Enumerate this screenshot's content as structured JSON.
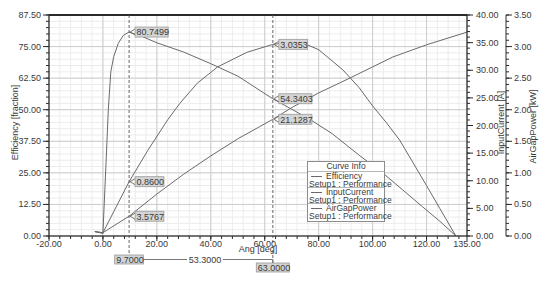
{
  "chart_data": {
    "type": "line",
    "title": "",
    "grid": true,
    "x_axis": {
      "label": "Ang [deg]",
      "range": [
        -20,
        135
      ],
      "ticks": [
        -20,
        0,
        20,
        40,
        60,
        80,
        100,
        120,
        135
      ],
      "tick_labels": [
        "-20.00",
        "0.00",
        "20.00",
        "40.00",
        "60.00",
        "80.00",
        "100.00",
        "120.00",
        "135.00"
      ],
      "minor_step": 4
    },
    "y_axes": [
      {
        "id": "left",
        "label": "Efficiency [fraction]",
        "range": [
          0,
          87.5
        ],
        "ticks": [
          0,
          12.5,
          25,
          37.5,
          50,
          62.5,
          75,
          87.5
        ],
        "tick_labels": [
          "0.00",
          "12.50",
          "25.00",
          "37.50",
          "50.00",
          "62.50",
          "75.00",
          "87.50"
        ],
        "minor_step": 2.5
      },
      {
        "id": "right1",
        "label": "InputCurrent [A]",
        "range": [
          0,
          40
        ],
        "ticks": [
          0,
          5,
          10,
          15,
          20,
          25,
          30,
          35,
          40
        ],
        "tick_labels": [
          "0.00",
          "5.00",
          "10.00",
          "15.00",
          "20.00",
          "25.00",
          "30.00",
          "35.00",
          "40.00"
        ],
        "minor_step": 1
      },
      {
        "id": "right2",
        "label": "AirGapPower [kW]",
        "range": [
          0,
          3.5
        ],
        "ticks": [
          0,
          0.5,
          1,
          1.5,
          2,
          2.5,
          3,
          3.5
        ],
        "tick_labels": [
          "0.00",
          "0.50",
          "1.00",
          "1.50",
          "2.00",
          "2.50",
          "3.00",
          "3.50"
        ],
        "minor_step": 0.1
      }
    ],
    "series": [
      {
        "name": "Efficiency",
        "setup": "Setup1 : Performance",
        "axis": "left",
        "color": "#6a6a6a",
        "points": [
          [
            -3,
            1.8
          ],
          [
            0,
            1.0
          ],
          [
            1,
            25
          ],
          [
            2,
            50
          ],
          [
            2.9,
            65
          ],
          [
            4,
            71
          ],
          [
            5.7,
            76.3
          ],
          [
            7.5,
            79.4
          ],
          [
            9.7,
            80.75
          ],
          [
            15,
            78.8
          ],
          [
            20,
            76.5
          ],
          [
            30,
            72.8
          ],
          [
            40,
            68.2
          ],
          [
            50,
            63.3
          ],
          [
            63,
            54.34
          ],
          [
            70,
            50.2
          ],
          [
            77,
            46
          ],
          [
            85,
            40.5
          ],
          [
            95,
            32
          ],
          [
            103.8,
            24.9
          ],
          [
            111.2,
            18.2
          ],
          [
            118.6,
            11.5
          ],
          [
            125,
            5.8
          ],
          [
            130.9,
            0
          ]
        ]
      },
      {
        "name": "InputCurrent",
        "setup": "Setup1 : Performance",
        "axis": "right1",
        "color": "#6a6a6a",
        "points": [
          [
            -3,
            0.8
          ],
          [
            0,
            0.6
          ],
          [
            9.7,
            3.58
          ],
          [
            20,
            7.6
          ],
          [
            30,
            11.2
          ],
          [
            40,
            14.5
          ],
          [
            50,
            17.6
          ],
          [
            63,
            21.13
          ],
          [
            70.4,
            23.35
          ],
          [
            80,
            25.9
          ],
          [
            91.6,
            28.6
          ],
          [
            100,
            30.6
          ],
          [
            107.5,
            32.4
          ],
          [
            120,
            34.6
          ],
          [
            135,
            36.9
          ]
        ]
      },
      {
        "name": "AirGapPower",
        "setup": "Setup1 : Performance",
        "axis": "right2",
        "color": "#6a6a6a",
        "points": [
          [
            -3,
            0.07
          ],
          [
            0,
            0.05
          ],
          [
            9.7,
            0.86
          ],
          [
            16.7,
            1.36
          ],
          [
            24,
            1.84
          ],
          [
            28.5,
            2.1
          ],
          [
            35,
            2.42
          ],
          [
            42.6,
            2.68
          ],
          [
            53.4,
            2.91
          ],
          [
            63,
            3.035
          ],
          [
            70,
            3.07
          ],
          [
            74,
            3.06
          ],
          [
            80,
            2.95
          ],
          [
            89,
            2.63
          ],
          [
            95,
            2.35
          ],
          [
            100,
            2.06
          ],
          [
            105,
            1.8
          ],
          [
            110,
            1.52
          ],
          [
            115,
            1.16
          ],
          [
            120,
            0.8
          ],
          [
            125,
            0.43
          ],
          [
            130.9,
            0
          ]
        ]
      }
    ],
    "markers": [
      {
        "x": 9.7,
        "label": "9.7000",
        "values": [
          {
            "series": "Efficiency",
            "value": 80.7499,
            "label": "80.7499"
          },
          {
            "series": "AirGapPower",
            "value": 0.86,
            "label": "0.8600"
          },
          {
            "series": "InputCurrent",
            "value": 3.5767,
            "label": "3.5767"
          }
        ]
      },
      {
        "x": 63,
        "label": "63.0000",
        "values": [
          {
            "series": "AirGapPower",
            "value": 3.0353,
            "label": "3.0353"
          },
          {
            "series": "Efficiency",
            "value": 54.3403,
            "label": "54.3403"
          },
          {
            "series": "InputCurrent",
            "value": 21.1287,
            "label": "21.1287"
          }
        ]
      }
    ],
    "delta": {
      "label": "53.3000",
      "value": 53.3
    },
    "legend": {
      "title": "Curve Info",
      "position": "inside lower right"
    },
    "colors": {
      "curve": "#6a6a6a",
      "grid_major": "#cdcdcd",
      "grid_minor": "#ececec",
      "axis": "#2a2a2a",
      "marker_box": "#d4d4d4"
    }
  }
}
